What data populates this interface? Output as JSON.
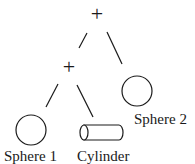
{
  "diagram": {
    "type": "csg-tree",
    "nodes": [
      {
        "id": "root",
        "kind": "operator",
        "label": "+"
      },
      {
        "id": "union1",
        "kind": "operator",
        "label": "+"
      },
      {
        "id": "sphere1",
        "kind": "primitive",
        "shape": "sphere",
        "label": "Sphere 1"
      },
      {
        "id": "cylinder",
        "kind": "primitive",
        "shape": "cylinder",
        "label": "Cylinder"
      },
      {
        "id": "sphere2",
        "kind": "primitive",
        "shape": "sphere",
        "label": "Sphere 2"
      }
    ],
    "edges": [
      {
        "from": "root",
        "to": "union1"
      },
      {
        "from": "root",
        "to": "sphere2"
      },
      {
        "from": "union1",
        "to": "sphere1"
      },
      {
        "from": "union1",
        "to": "cylinder"
      }
    ],
    "labels": {
      "root_op": "+",
      "union1_op": "+",
      "sphere1": "Sphere 1",
      "cylinder": "Cylinder",
      "sphere2": "Sphere 2"
    },
    "colors": {
      "stroke": "#1a1a1a",
      "background": "#ffffff"
    }
  }
}
